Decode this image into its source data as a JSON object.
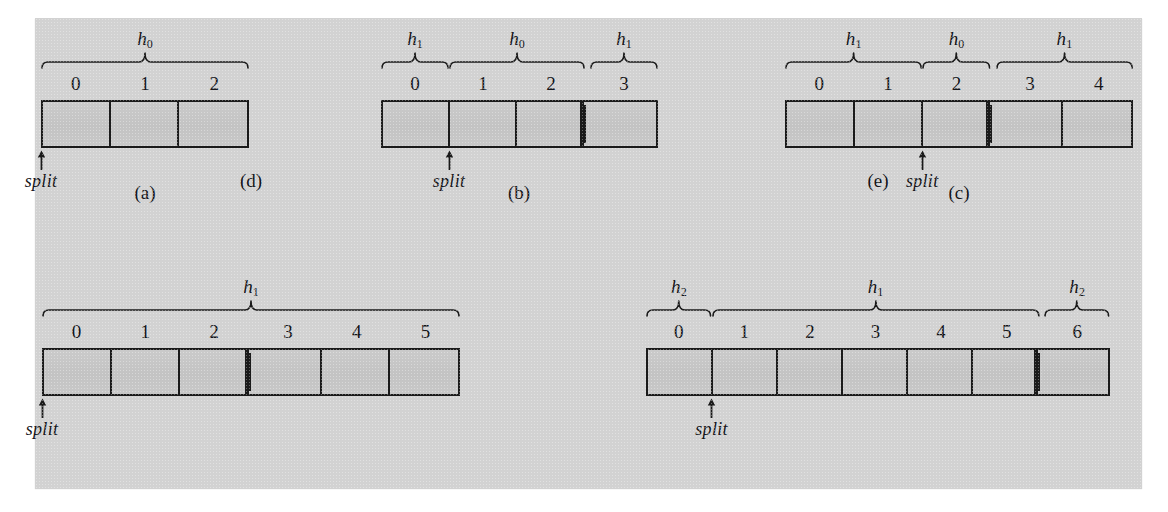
{
  "figure": {
    "background_color": "#d2d2d2",
    "cell_fill_color": "#c6c6c6",
    "stroke_color": "#1a1a1a",
    "split_label": "split"
  },
  "panels": [
    {
      "id": "a",
      "caption": "(a)",
      "cells": [
        "0",
        "1",
        "2"
      ],
      "split_index": 0,
      "double_line_after": null,
      "braces": [
        {
          "label": "h",
          "sub": "0",
          "from": 0,
          "to": 2
        }
      ]
    },
    {
      "id": "b",
      "caption": "(b)",
      "cells": [
        "0",
        "1",
        "2",
        "3"
      ],
      "split_index": 1,
      "double_line_after": 2,
      "braces": [
        {
          "label": "h",
          "sub": "1",
          "from": 0,
          "to": 0
        },
        {
          "label": "h",
          "sub": "0",
          "from": 1,
          "to": 2
        },
        {
          "label": "h",
          "sub": "1",
          "from": 3,
          "to": 3
        }
      ]
    },
    {
      "id": "c",
      "caption": "(c)",
      "cells": [
        "0",
        "1",
        "2",
        "3",
        "4"
      ],
      "split_index": 2,
      "double_line_after": 2,
      "braces": [
        {
          "label": "h",
          "sub": "1",
          "from": 0,
          "to": 1
        },
        {
          "label": "h",
          "sub": "0",
          "from": 2,
          "to": 2
        },
        {
          "label": "h",
          "sub": "1",
          "from": 3,
          "to": 4
        }
      ]
    },
    {
      "id": "d",
      "caption": "(d)",
      "cells": [
        "0",
        "1",
        "2",
        "3",
        "4",
        "5"
      ],
      "split_index": 0,
      "double_line_after": 2,
      "braces": [
        {
          "label": "h",
          "sub": "1",
          "from": 0,
          "to": 5
        }
      ]
    },
    {
      "id": "e",
      "caption": "(e)",
      "cells": [
        "0",
        "1",
        "2",
        "3",
        "4",
        "5",
        "6"
      ],
      "split_index": 1,
      "double_line_after": 5,
      "braces": [
        {
          "label": "h",
          "sub": "2",
          "from": 0,
          "to": 0
        },
        {
          "label": "h",
          "sub": "1",
          "from": 1,
          "to": 5
        },
        {
          "label": "h",
          "sub": "2",
          "from": 6,
          "to": 6
        }
      ]
    }
  ],
  "layout": {
    "panel_boxes": [
      {
        "id": "a",
        "left": 41,
        "top": 30,
        "width": 208,
        "cell_h": 48
      },
      {
        "id": "b",
        "left": 381,
        "top": 30,
        "width": 277,
        "cell_h": 48
      },
      {
        "id": "c",
        "left": 785,
        "top": 30,
        "width": 348,
        "cell_h": 48
      },
      {
        "id": "d",
        "left": 42,
        "top": 278,
        "width": 418,
        "cell_h": 48
      },
      {
        "id": "e",
        "left": 646,
        "top": 278,
        "width": 464,
        "cell_h": 48
      }
    ],
    "caption_offsets": [
      {
        "id": "a",
        "x": 145,
        "y": 182
      },
      {
        "id": "b",
        "x": 519,
        "y": 182
      },
      {
        "id": "c",
        "x": 959,
        "y": 182
      },
      {
        "id": "d",
        "x": 251,
        "y": 170
      },
      {
        "id": "e",
        "x": 878,
        "y": 170
      }
    ]
  }
}
